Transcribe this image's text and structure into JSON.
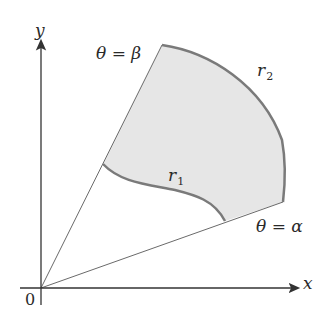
{
  "diagram": {
    "labels": {
      "y_axis": "y",
      "x_axis": "x",
      "origin": "0",
      "beta_eq": {
        "theta": "θ",
        "eq": "=",
        "angle": "β"
      },
      "alpha_eq": {
        "theta": "θ",
        "eq": "=",
        "angle": "α"
      },
      "r1": {
        "base": "r",
        "sub": "1"
      },
      "r2": {
        "base": "r",
        "sub": "2"
      }
    },
    "colors": {
      "region_fill": "#e6e6e6",
      "boundary": "#7a7a7a",
      "axes": "#333333",
      "rays": "#6a6a6a"
    }
  }
}
